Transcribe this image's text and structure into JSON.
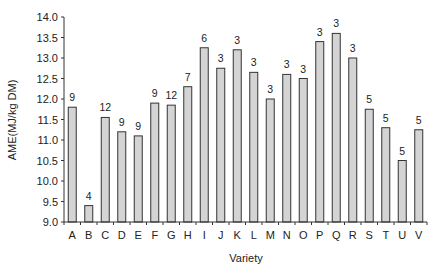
{
  "chart_data": {
    "type": "bar",
    "title": "",
    "xlabel": "Variety",
    "ylabel": "AME(MJ/kg DM)",
    "ylim": [
      9.0,
      14.0
    ],
    "yticks": [
      "9.0",
      "9.5",
      "10.0",
      "10.5",
      "11.0",
      "11.5",
      "12.0",
      "12.5",
      "13.0",
      "13.5",
      "14.0"
    ],
    "grid": false,
    "legend": null,
    "categories": [
      "A",
      "B",
      "C",
      "D",
      "E",
      "F",
      "G",
      "H",
      "I",
      "J",
      "K",
      "L",
      "M",
      "N",
      "O",
      "P",
      "Q",
      "R",
      "S",
      "T",
      "U",
      "V"
    ],
    "values": [
      11.8,
      9.4,
      11.55,
      11.2,
      11.1,
      11.9,
      11.85,
      12.3,
      13.25,
      12.75,
      13.2,
      12.65,
      12.0,
      12.6,
      12.5,
      13.4,
      13.6,
      13.0,
      11.75,
      11.3,
      10.5,
      11.25
    ],
    "data_labels": [
      "9",
      "4",
      "12",
      "9",
      "9",
      "9",
      "12",
      "7",
      "6",
      "3",
      "3",
      "3",
      "3",
      "3",
      "3",
      "3",
      "3",
      "3",
      "5",
      "5",
      "5",
      "5"
    ],
    "colors": {
      "bar_fill": "#d4d4d4",
      "bar_stroke": "#333333",
      "axis": "#333333"
    }
  }
}
